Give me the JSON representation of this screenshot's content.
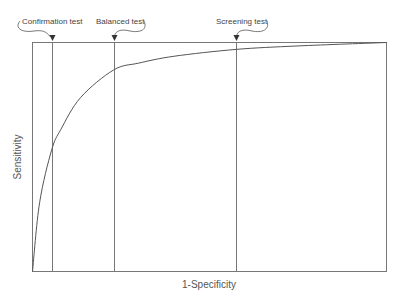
{
  "chart_data": {
    "type": "line",
    "title": "",
    "xlabel": "1-Specificity",
    "ylabel": "Sensitivity",
    "xlim": [
      0,
      1
    ],
    "ylim": [
      0,
      1
    ],
    "grid": false,
    "legend": null,
    "series": [
      {
        "name": "ROC curve",
        "x": [
          0.0,
          0.02,
          0.054,
          0.08,
          0.136,
          0.229,
          0.3,
          0.4,
          0.576,
          0.75,
          1.0
        ],
        "y": [
          0.0,
          0.3,
          0.53,
          0.62,
          0.76,
          0.88,
          0.91,
          0.94,
          0.97,
          0.985,
          1.0
        ]
      }
    ],
    "annotations": [
      {
        "label": "Confirmation test",
        "x": 0.054,
        "type": "vertical-line"
      },
      {
        "label": "Balanced test",
        "x": 0.229,
        "type": "vertical-line"
      },
      {
        "label": "Screening test",
        "x": 0.576,
        "type": "vertical-line"
      }
    ]
  },
  "colors": {
    "line": "#555555",
    "frame": "#666666",
    "text": "#444444"
  }
}
